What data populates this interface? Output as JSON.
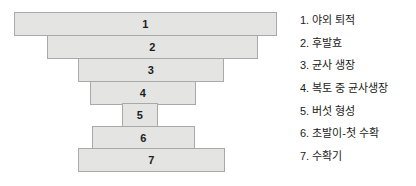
{
  "figure": {
    "title": "",
    "bar_fill_color": "#e4e4e2",
    "bar_border_color": "#a9a9a9",
    "background_color": "#ffffff",
    "text_color": "#1b1b1b"
  },
  "chart_data": {
    "type": "bar",
    "orientation": "horizontal",
    "title": "",
    "xlabel": "",
    "ylabel": "",
    "grid": false,
    "legend_position": "right",
    "categories": [
      "1",
      "2",
      "3",
      "4",
      "5",
      "6",
      "7"
    ],
    "values": [
      263,
      211,
      146,
      106,
      36,
      103,
      147
    ],
    "bars": [
      {
        "label": "1",
        "x": 14,
        "y": 12,
        "width": 263,
        "height": 24
      },
      {
        "label": "2",
        "x": 47,
        "y": 35,
        "width": 211,
        "height": 24
      },
      {
        "label": "3",
        "x": 78,
        "y": 58,
        "width": 146,
        "height": 24
      },
      {
        "label": "4",
        "x": 90,
        "y": 81,
        "width": 106,
        "height": 24
      },
      {
        "label": "5",
        "x": 122,
        "y": 103,
        "width": 36,
        "height": 24
      },
      {
        "label": "6",
        "x": 92,
        "y": 126,
        "width": 103,
        "height": 24
      },
      {
        "label": "7",
        "x": 78,
        "y": 148,
        "width": 147,
        "height": 24
      }
    ]
  },
  "legend": {
    "items": [
      {
        "number": "1.",
        "label": "야외 퇴적",
        "text": "1. 야외 퇴적"
      },
      {
        "number": "2.",
        "label": "후발효",
        "text": "2. 후발효"
      },
      {
        "number": "3.",
        "label": "균사 생장",
        "text": "3. 균사 생장"
      },
      {
        "number": "4.",
        "label": "복토 중 균사생장",
        "text": "4. 복토 중 균사생장"
      },
      {
        "number": "5.",
        "label": "버섯 형성",
        "text": "5. 버섯 형성"
      },
      {
        "number": "6.",
        "label": "초발이-첫 수확",
        "text": "6. 초발이-첫 수확"
      },
      {
        "number": "7.",
        "label": "수확기",
        "text": "7. 수확기"
      }
    ]
  }
}
